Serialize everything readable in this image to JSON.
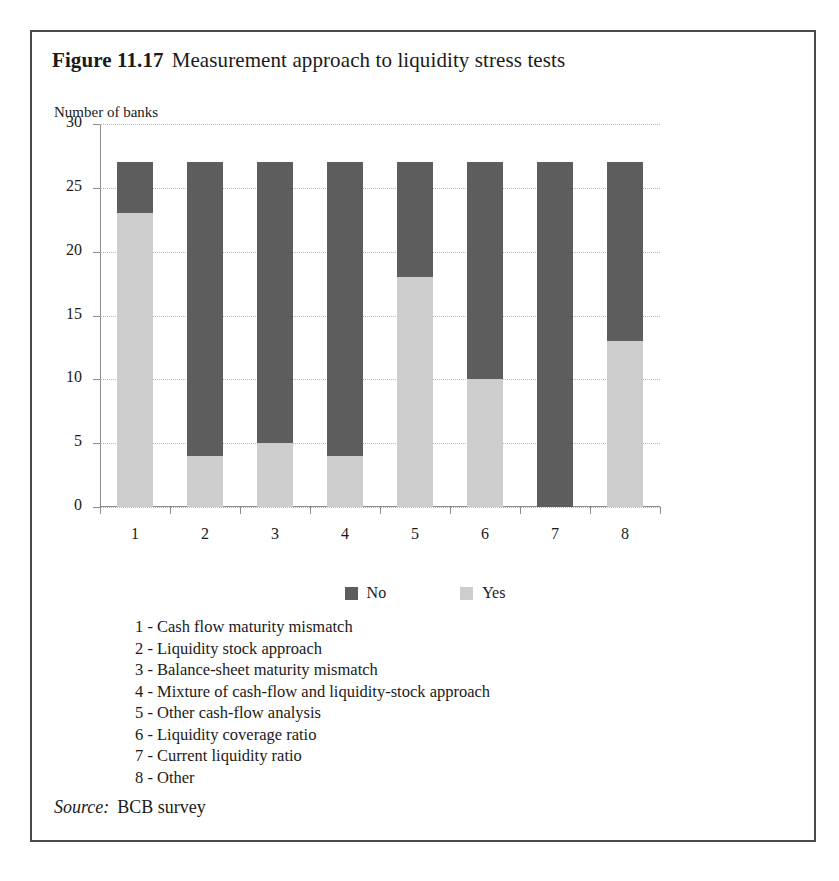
{
  "figure": {
    "label": "Figure 11.17",
    "caption": "Measurement approach to liquidity stress tests"
  },
  "axis_title": "Number of banks",
  "source": {
    "label": "Source:",
    "value": "BCB survey"
  },
  "colors": {
    "no": "#5d5d5d",
    "yes": "#cdcdcd",
    "axis": "#8d8d8d",
    "grid": "#b9b9b9",
    "frame": "#4a4a4a",
    "text": "#1a1a1a"
  },
  "category_key": [
    "1 - Cash flow maturity mismatch",
    "2 - Liquidity stock approach",
    "3 - Balance-sheet maturity mismatch",
    "4 - Mixture of cash-flow and liquidity-stock approach",
    "5 - Other cash-flow analysis",
    "6 - Liquidity coverage ratio",
    "7 - Current liquidity ratio",
    "8 - Other"
  ],
  "chart_data": {
    "type": "bar",
    "stacked": true,
    "title": "Measurement approach to liquidity stress tests",
    "xlabel": "",
    "ylabel": "Number of banks",
    "ylim": [
      0,
      30
    ],
    "yticks": [
      0,
      5,
      10,
      15,
      20,
      25,
      30
    ],
    "ytick_labels": [
      "0",
      "5",
      "10",
      "15",
      "20",
      "25",
      "30"
    ],
    "grid": true,
    "legend_position": "bottom",
    "categories": [
      "1",
      "2",
      "3",
      "4",
      "5",
      "6",
      "7",
      "8"
    ],
    "category_names": [
      "Cash flow maturity mismatch",
      "Liquidity stock approach",
      "Balance-sheet maturity mismatch",
      "Mixture of cash-flow and liquidity-stock approach",
      "Other cash-flow analysis",
      "Liquidity coverage ratio",
      "Current liquidity ratio",
      "Other"
    ],
    "series": [
      {
        "name": "Yes",
        "color": "#cdcdcd",
        "values": [
          23,
          4,
          5,
          4,
          18,
          10,
          0,
          13
        ]
      },
      {
        "name": "No",
        "color": "#5d5d5d",
        "values": [
          4,
          23,
          22,
          23,
          9,
          17,
          27,
          14
        ]
      }
    ],
    "totals": [
      27,
      27,
      27,
      27,
      27,
      27,
      27,
      27
    ]
  }
}
